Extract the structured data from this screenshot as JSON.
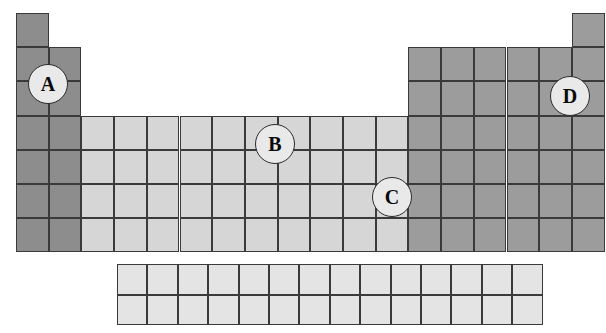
{
  "diagram": {
    "type": "periodic-table-blocks",
    "geometry": {
      "image_width": 606,
      "image_height": 333,
      "cell_width": 32.7,
      "cell_height": 34.2,
      "main_grid_left": 16,
      "main_grid_top": 13,
      "main_grid_columns": 18,
      "main_grid_rows": 7,
      "fblock_left": 117,
      "fblock_top": 264,
      "fblock_columns": 14,
      "fblock_rows": 2,
      "fblock_cell_width": 30.4,
      "fblock_cell_height": 30.5
    },
    "colors": {
      "s_block_fill": "#8d8d8d",
      "d_block_fill": "#d6d6d6",
      "p_block_fill": "#9c9c9c",
      "f_block_fill": "#e4e4e4",
      "grid_line": "#3a3a3a",
      "marker_fill": "#e9e9e9",
      "marker_border": "#2a2a2a",
      "marker_text": "#0a0a0a",
      "background": "#ffffff"
    },
    "blocks": [
      {
        "name": "s-block",
        "fill_key": "s_block_fill",
        "shade": "dark gray",
        "groups": [
          1,
          2
        ],
        "description": "Left two columns, groups 1 and 2, plus hydrogen cell in period 1"
      },
      {
        "name": "d-block",
        "fill_key": "d_block_fill",
        "shade": "light gray",
        "groups": [
          3,
          4,
          5,
          6,
          7,
          8,
          9,
          10,
          11,
          12
        ],
        "description": "Central ten columns, transition metals, periods 4 to 7"
      },
      {
        "name": "p-block",
        "fill_key": "p_block_fill",
        "shade": "medium gray",
        "groups": [
          13,
          14,
          15,
          16,
          17,
          18
        ],
        "description": "Right six columns, plus helium cell in period 1"
      },
      {
        "name": "f-block",
        "fill_key": "f_block_fill",
        "shade": "very light gray",
        "groups": [],
        "description": "Detached 14 by 2 grid below the main table, lanthanides and actinides"
      }
    ],
    "markers": [
      {
        "label": "A",
        "cx": 48,
        "cy": 84,
        "radius": 20,
        "font_size": 20,
        "block": "s-block",
        "position_note": "Group 1 / group 2 boundary at the period 2 and period 3 junction, left edge of table"
      },
      {
        "label": "B",
        "cx": 275,
        "cy": 144,
        "radius": 20,
        "font_size": 20,
        "block": "d-block",
        "position_note": "Middle of the d-block, on the intersection between groups 8 and 9, periods 4 and 5"
      },
      {
        "label": "C",
        "cx": 392,
        "cy": 197,
        "radius": 20,
        "font_size": 20,
        "block": "d-block",
        "position_note": "Right edge of the d-block at the group 12 and group 13 boundary, periods 5 and 6"
      },
      {
        "label": "D",
        "cx": 570,
        "cy": 96,
        "radius": 20,
        "font_size": 20,
        "block": "p-block",
        "position_note": "Group 18 column, period 2 and 3 junction, right edge of table"
      }
    ],
    "main_cells": [
      {
        "col": 1,
        "row": 1,
        "block": "s-block"
      },
      {
        "col": 18,
        "row": 1,
        "block": "p-block"
      },
      {
        "col": 1,
        "row": 2,
        "block": "s-block"
      },
      {
        "col": 2,
        "row": 2,
        "block": "s-block"
      },
      {
        "col": 13,
        "row": 2,
        "block": "p-block"
      },
      {
        "col": 14,
        "row": 2,
        "block": "p-block"
      },
      {
        "col": 15,
        "row": 2,
        "block": "p-block"
      },
      {
        "col": 16,
        "row": 2,
        "block": "p-block"
      },
      {
        "col": 17,
        "row": 2,
        "block": "p-block"
      },
      {
        "col": 18,
        "row": 2,
        "block": "p-block"
      },
      {
        "col": 1,
        "row": 3,
        "block": "s-block"
      },
      {
        "col": 2,
        "row": 3,
        "block": "s-block"
      },
      {
        "col": 13,
        "row": 3,
        "block": "p-block"
      },
      {
        "col": 14,
        "row": 3,
        "block": "p-block"
      },
      {
        "col": 15,
        "row": 3,
        "block": "p-block"
      },
      {
        "col": 16,
        "row": 3,
        "block": "p-block"
      },
      {
        "col": 17,
        "row": 3,
        "block": "p-block"
      },
      {
        "col": 18,
        "row": 3,
        "block": "p-block"
      },
      {
        "col": 1,
        "row": 4,
        "block": "s-block"
      },
      {
        "col": 2,
        "row": 4,
        "block": "s-block"
      },
      {
        "col": 3,
        "row": 4,
        "block": "d-block"
      },
      {
        "col": 4,
        "row": 4,
        "block": "d-block"
      },
      {
        "col": 5,
        "row": 4,
        "block": "d-block"
      },
      {
        "col": 6,
        "row": 4,
        "block": "d-block"
      },
      {
        "col": 7,
        "row": 4,
        "block": "d-block"
      },
      {
        "col": 8,
        "row": 4,
        "block": "d-block"
      },
      {
        "col": 9,
        "row": 4,
        "block": "d-block"
      },
      {
        "col": 10,
        "row": 4,
        "block": "d-block"
      },
      {
        "col": 11,
        "row": 4,
        "block": "d-block"
      },
      {
        "col": 12,
        "row": 4,
        "block": "d-block"
      },
      {
        "col": 13,
        "row": 4,
        "block": "p-block"
      },
      {
        "col": 14,
        "row": 4,
        "block": "p-block"
      },
      {
        "col": 15,
        "row": 4,
        "block": "p-block"
      },
      {
        "col": 16,
        "row": 4,
        "block": "p-block"
      },
      {
        "col": 17,
        "row": 4,
        "block": "p-block"
      },
      {
        "col": 18,
        "row": 4,
        "block": "p-block"
      },
      {
        "col": 1,
        "row": 5,
        "block": "s-block"
      },
      {
        "col": 2,
        "row": 5,
        "block": "s-block"
      },
      {
        "col": 3,
        "row": 5,
        "block": "d-block"
      },
      {
        "col": 4,
        "row": 5,
        "block": "d-block"
      },
      {
        "col": 5,
        "row": 5,
        "block": "d-block"
      },
      {
        "col": 6,
        "row": 5,
        "block": "d-block"
      },
      {
        "col": 7,
        "row": 5,
        "block": "d-block"
      },
      {
        "col": 8,
        "row": 5,
        "block": "d-block"
      },
      {
        "col": 9,
        "row": 5,
        "block": "d-block"
      },
      {
        "col": 10,
        "row": 5,
        "block": "d-block"
      },
      {
        "col": 11,
        "row": 5,
        "block": "d-block"
      },
      {
        "col": 12,
        "row": 5,
        "block": "d-block"
      },
      {
        "col": 13,
        "row": 5,
        "block": "p-block"
      },
      {
        "col": 14,
        "row": 5,
        "block": "p-block"
      },
      {
        "col": 15,
        "row": 5,
        "block": "p-block"
      },
      {
        "col": 16,
        "row": 5,
        "block": "p-block"
      },
      {
        "col": 17,
        "row": 5,
        "block": "p-block"
      },
      {
        "col": 18,
        "row": 5,
        "block": "p-block"
      },
      {
        "col": 1,
        "row": 6,
        "block": "s-block"
      },
      {
        "col": 2,
        "row": 6,
        "block": "s-block"
      },
      {
        "col": 3,
        "row": 6,
        "block": "d-block"
      },
      {
        "col": 4,
        "row": 6,
        "block": "d-block"
      },
      {
        "col": 5,
        "row": 6,
        "block": "d-block"
      },
      {
        "col": 6,
        "row": 6,
        "block": "d-block"
      },
      {
        "col": 7,
        "row": 6,
        "block": "d-block"
      },
      {
        "col": 8,
        "row": 6,
        "block": "d-block"
      },
      {
        "col": 9,
        "row": 6,
        "block": "d-block"
      },
      {
        "col": 10,
        "row": 6,
        "block": "d-block"
      },
      {
        "col": 11,
        "row": 6,
        "block": "d-block"
      },
      {
        "col": 12,
        "row": 6,
        "block": "d-block"
      },
      {
        "col": 13,
        "row": 6,
        "block": "p-block"
      },
      {
        "col": 14,
        "row": 6,
        "block": "p-block"
      },
      {
        "col": 15,
        "row": 6,
        "block": "p-block"
      },
      {
        "col": 16,
        "row": 6,
        "block": "p-block"
      },
      {
        "col": 17,
        "row": 6,
        "block": "p-block"
      },
      {
        "col": 18,
        "row": 6,
        "block": "p-block"
      },
      {
        "col": 1,
        "row": 7,
        "block": "s-block"
      },
      {
        "col": 2,
        "row": 7,
        "block": "s-block"
      },
      {
        "col": 3,
        "row": 7,
        "block": "d-block"
      },
      {
        "col": 4,
        "row": 7,
        "block": "d-block"
      },
      {
        "col": 5,
        "row": 7,
        "block": "d-block"
      },
      {
        "col": 6,
        "row": 7,
        "block": "d-block"
      },
      {
        "col": 7,
        "row": 7,
        "block": "d-block"
      },
      {
        "col": 8,
        "row": 7,
        "block": "d-block"
      },
      {
        "col": 9,
        "row": 7,
        "block": "d-block"
      },
      {
        "col": 10,
        "row": 7,
        "block": "d-block"
      },
      {
        "col": 11,
        "row": 7,
        "block": "d-block"
      },
      {
        "col": 12,
        "row": 7,
        "block": "d-block"
      },
      {
        "col": 13,
        "row": 7,
        "block": "p-block"
      },
      {
        "col": 14,
        "row": 7,
        "block": "p-block"
      },
      {
        "col": 15,
        "row": 7,
        "block": "p-block"
      },
      {
        "col": 16,
        "row": 7,
        "block": "p-block"
      },
      {
        "col": 17,
        "row": 7,
        "block": "p-block"
      },
      {
        "col": 18,
        "row": 7,
        "block": "p-block"
      }
    ]
  }
}
